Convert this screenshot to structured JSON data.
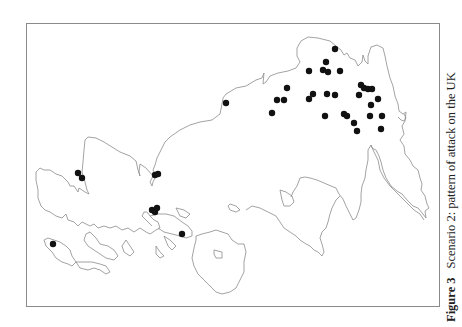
{
  "figure": {
    "label": "Figure 3",
    "caption": "Scenario 2: pattern of attack on the UK"
  },
  "map": {
    "coast_color": "#8c8c8c",
    "marker_color": "#111111",
    "marker_radius": 3.2,
    "attack_points": [
      [
        335,
        49
      ],
      [
        326,
        62
      ],
      [
        309,
        71
      ],
      [
        323,
        70
      ],
      [
        328,
        72
      ],
      [
        340,
        71
      ],
      [
        287,
        88
      ],
      [
        361,
        85
      ],
      [
        364,
        88
      ],
      [
        368,
        89
      ],
      [
        372,
        89
      ],
      [
        313,
        94
      ],
      [
        327,
        94
      ],
      [
        335,
        95
      ],
      [
        309,
        99
      ],
      [
        277,
        100
      ],
      [
        284,
        100
      ],
      [
        359,
        95
      ],
      [
        378,
        99
      ],
      [
        371,
        105
      ],
      [
        272,
        113
      ],
      [
        325,
        116
      ],
      [
        344,
        114
      ],
      [
        347,
        116
      ],
      [
        370,
        116
      ],
      [
        382,
        116
      ],
      [
        354,
        123
      ],
      [
        357,
        131
      ],
      [
        381,
        129
      ],
      [
        226,
        103
      ],
      [
        78,
        173
      ],
      [
        82,
        178
      ],
      [
        155,
        175
      ],
      [
        158,
        174
      ],
      [
        152,
        210
      ],
      [
        155,
        212
      ],
      [
        157,
        208
      ],
      [
        182,
        234
      ],
      [
        53,
        244
      ]
    ]
  }
}
